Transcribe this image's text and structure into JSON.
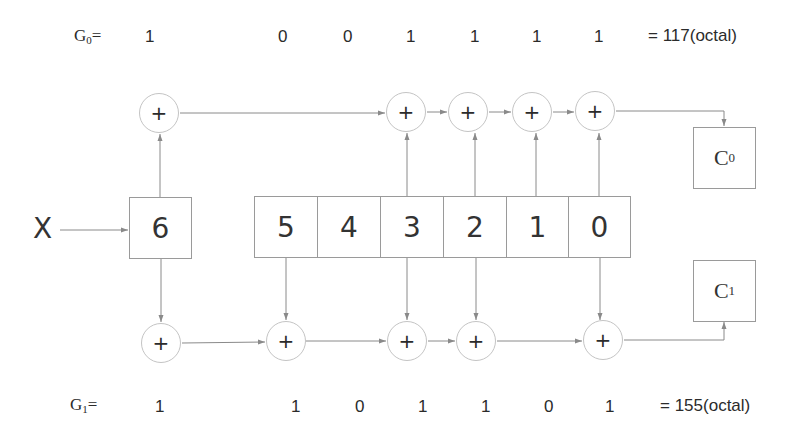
{
  "generators": {
    "g0": {
      "name": "G",
      "sub": "0",
      "eq": "=",
      "bits": [
        "1",
        "0",
        "0",
        "1",
        "1",
        "1",
        "1"
      ],
      "octal": "= 117(octal)"
    },
    "g1": {
      "name": "G",
      "sub": "1",
      "eq": "=",
      "bits": [
        "1",
        "1",
        "0",
        "1",
        "1",
        "0",
        "1"
      ],
      "octal": "= 155(octal)"
    }
  },
  "input": {
    "label": "X"
  },
  "current_stage": {
    "label": "6"
  },
  "shift_register": {
    "cells": [
      "5",
      "4",
      "3",
      "2",
      "1",
      "0"
    ]
  },
  "outputs": {
    "c0": {
      "name": "C",
      "sub": "0"
    },
    "c1": {
      "name": "C",
      "sub": "1"
    }
  },
  "adders": {
    "symbol": "+",
    "top_count": 5,
    "bottom_count": 5
  },
  "colors": {
    "line": "#8a8a8a",
    "border": "#9a9a9a",
    "text": "#2b2b2b",
    "background": "#ffffff"
  }
}
